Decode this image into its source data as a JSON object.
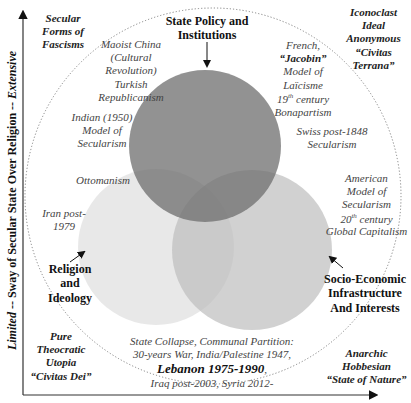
{
  "axes": {
    "y_label": {
      "low": "Limited",
      "sep1": " -- ",
      "mid": "Sway of Secular State Over Religion",
      "sep2": " -- ",
      "high": "Extensive"
    }
  },
  "corners": {
    "top_left": [
      "Secular",
      "Forms of",
      "Fascisms"
    ],
    "top_right": [
      "Iconoclast",
      "Ideal",
      "Anonymous",
      "“Civitas",
      "Terrana”"
    ],
    "bottom_left": [
      "Pure",
      "Theocratic",
      "Utopia",
      "“Civitas Dei”"
    ],
    "bottom_right": [
      "Anarchic",
      "Hobbesian",
      "“State of Nature”"
    ]
  },
  "circles": {
    "state": {
      "label": [
        "State Policy and",
        "Institutions"
      ],
      "color": "#7f7f7f"
    },
    "religion": {
      "label": [
        "Religion",
        "and",
        "Ideology"
      ],
      "color": "#e3e3e3"
    },
    "socio": {
      "label": [
        "Socio-Economic",
        "Infrastructure",
        "And Interests"
      ],
      "color": "#c9c9c9"
    }
  },
  "examples": {
    "maoist": [
      "Maoist China",
      "(Cultural",
      "Revolution)",
      "Turkish",
      "Republicanism"
    ],
    "french": {
      "l1": "French,",
      "l2": "“Jacobin”",
      "l3": "Model of",
      "l4": "Laïcisme",
      "l5a": "19",
      "l5sup": "th",
      "l5b": " century",
      "l6": "Bonapartism"
    },
    "indian": [
      "Indian (1950)",
      "Model of",
      "Secularism"
    ],
    "swiss": [
      "Swiss post-1848",
      "Secularism"
    ],
    "ottomanism": "Ottomanism",
    "iran": [
      "Iran post-",
      "1979"
    ],
    "american": {
      "l1": "American",
      "l2": "Model of",
      "l3": "Secularism",
      "l4a": "20",
      "l4sup": "th",
      "l4b": " century",
      "l5": "Global Capitalism"
    },
    "collapse": {
      "l1": "State Collapse, Communal Partition:",
      "l2": "30-years War, India/Palestine 1947,",
      "l3": "Lebanon 1975-1990",
      "l3tail": ",",
      "l4": "Iraq post-2003, Syria 2012-"
    }
  }
}
